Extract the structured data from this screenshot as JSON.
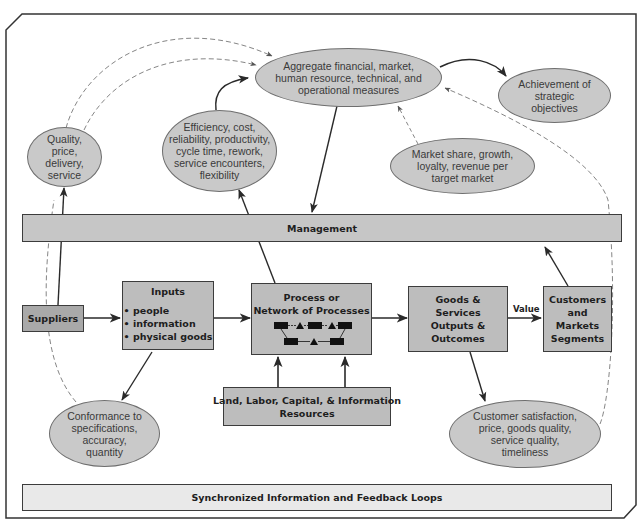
{
  "diagram": {
    "ellipses": {
      "aggregate": {
        "lines": [
          "Aggregate financial, market,",
          "human resource, technical, and",
          "operational measures"
        ]
      },
      "achievement": {
        "lines": [
          "Achievement of",
          "strategic",
          "objectives"
        ]
      },
      "quality": {
        "lines": [
          "Quality,",
          "price,",
          "delivery,",
          "service"
        ]
      },
      "efficiency": {
        "lines": [
          "Efficiency, cost,",
          "reliability, productivity,",
          "cycle time, rework,",
          "service encounters,",
          "flexibility"
        ]
      },
      "market_share": {
        "lines": [
          "Market share, growth,",
          "loyalty, revenue per",
          "target market"
        ]
      },
      "conformance": {
        "lines": [
          "Conformance to",
          "specifications,",
          "accuracy,",
          "quantity"
        ]
      },
      "customer_satisfaction": {
        "lines": [
          "Customer satisfaction,",
          "price, goods quality,",
          "service quality,",
          "timeliness"
        ]
      }
    },
    "bars": {
      "management": "Management",
      "feedback": "Synchronized Information and Feedback Loops"
    },
    "boxes": {
      "suppliers": {
        "lines": [
          "Suppliers"
        ]
      },
      "inputs": {
        "title": "Inputs",
        "items": [
          "• people",
          "• information",
          "• physical goods"
        ]
      },
      "process": {
        "lines": [
          "Process or",
          "Network of Processes"
        ]
      },
      "resources": {
        "lines": [
          "Land, Labor, Capital, & Information",
          "Resources"
        ]
      },
      "outputs": {
        "lines": [
          "Goods &",
          "Services",
          "Outputs &",
          "Outcomes"
        ]
      },
      "customers": {
        "lines": [
          "Customers",
          "and",
          "Markets",
          "Segments"
        ]
      }
    },
    "edge_labels": {
      "value": "Value"
    },
    "colors": {
      "ellipse_fill": "#c9c9c9",
      "box_fill": "#bdbdbd",
      "suppliers_fill": "#a9a9a9",
      "management_fill": "#c6c6c6",
      "feedback_fill": "#e9e9e9",
      "line": "#2a2a2a",
      "dashed": "#8a8a8a"
    }
  }
}
